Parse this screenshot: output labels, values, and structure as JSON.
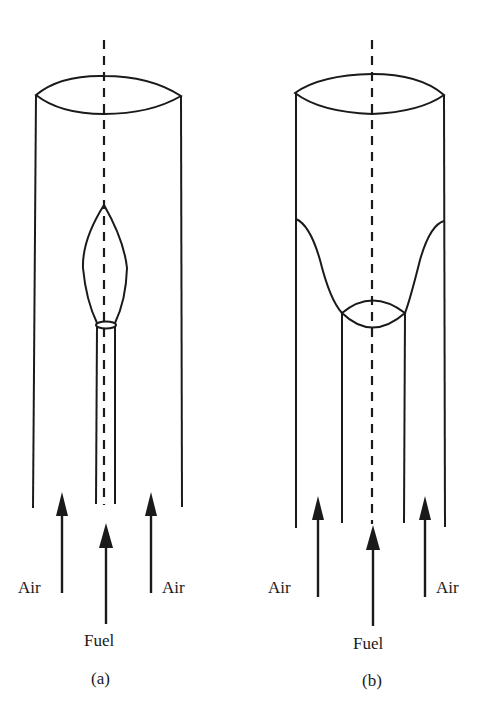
{
  "figure": {
    "panels": [
      {
        "id": "a",
        "caption": "(a)",
        "description": "Jet flame from central fuel tube inside cylindrical air duct",
        "labels": {
          "air_left": "Air",
          "fuel": "Fuel",
          "air_right": "Air"
        }
      },
      {
        "id": "b",
        "caption": "(b)",
        "description": "Flame anchored at wide fuel tube, spreading to duct walls",
        "labels": {
          "air_left": "Air",
          "fuel": "Fuel",
          "air_right": "Air"
        }
      }
    ],
    "colors": {
      "line": "#1a1a1a",
      "background": "#ffffff"
    }
  }
}
